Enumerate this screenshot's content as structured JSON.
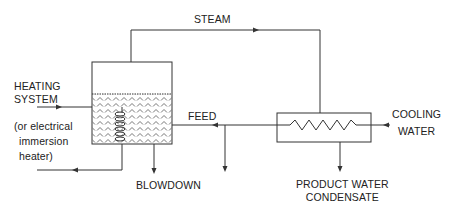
{
  "diagram": {
    "type": "process flow diagram",
    "labels": {
      "steam": "STEAM",
      "heating_line1": "HEATING",
      "heating_line2": "SYSTEM",
      "heating_alt1": "(or electrical",
      "heating_alt2": "immersion",
      "heating_alt3": "heater)",
      "feed": "FEED",
      "blowdown": "BLOWDOWN",
      "cooling_line1": "COOLING",
      "cooling_line2": "WATER",
      "product_line1": "PRODUCT WATER",
      "product_line2": "CONDENSATE"
    },
    "nodes": [
      {
        "id": "boiler",
        "shape": "vessel-with-liquid",
        "contains": "heating-coil"
      },
      {
        "id": "condenser",
        "shape": "heat-exchanger",
        "contains": "zigzag-coil"
      }
    ],
    "edges": [
      {
        "from": "boiler",
        "to": "condenser",
        "label": "STEAM"
      },
      {
        "from": "condenser",
        "to": "boiler",
        "label": "FEED"
      },
      {
        "from": "feed-line",
        "to": "drain",
        "label": ""
      },
      {
        "from": "boiler",
        "to": "out",
        "label": "BLOWDOWN"
      },
      {
        "from": "condenser",
        "to": "out",
        "label": "PRODUCT WATER CONDENSATE"
      },
      {
        "from": "in",
        "to": "condenser",
        "label": "COOLING WATER"
      },
      {
        "from": "in",
        "to": "boiler",
        "label": "HEATING SYSTEM"
      },
      {
        "from": "boiler",
        "to": "out",
        "label": "heating return"
      }
    ],
    "colors": {
      "line": "#333333",
      "background": "#ffffff"
    }
  }
}
